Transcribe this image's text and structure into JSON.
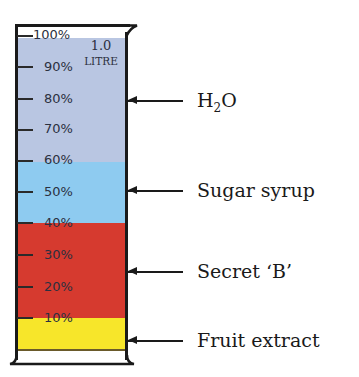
{
  "cylinder": {
    "capacity_line1": "1.0",
    "capacity_line2": "LITRE",
    "graduations": [
      "100%",
      "90%",
      "80%",
      "70%",
      "60%",
      "50%",
      "40%",
      "30%",
      "20%",
      "10%"
    ]
  },
  "layers": [
    {
      "name": "H2O",
      "label_main": "H",
      "label_sub": "2",
      "label_end": "O",
      "from_pct": 60,
      "to_pct": 100,
      "color": "#b9c6e2"
    },
    {
      "name": "Sugar syrup",
      "label": "Sugar syrup",
      "from_pct": 40,
      "to_pct": 60,
      "color": "#8ecbf0"
    },
    {
      "name": "Secret 'B'",
      "label": "Secret ‘B’",
      "from_pct": 10,
      "to_pct": 40,
      "color": "#d63a2f"
    },
    {
      "name": "Fruit extract",
      "label": "Fruit extract",
      "from_pct": 0,
      "to_pct": 10,
      "color": "#f7e62a"
    }
  ]
}
